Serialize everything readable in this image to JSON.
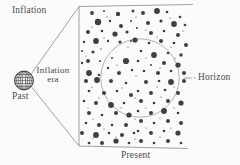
{
  "labels": {
    "inflation": "Inflation",
    "inflation_era_line1": "Inflation",
    "inflation_era_line2": "era",
    "past": "Past",
    "horizon": "Horizon",
    "present": "Present"
  },
  "colors": {
    "background": "#fbfbfb",
    "dot": "#3f3f3f",
    "line": "#8a8a8a",
    "horizon_circle": "#a8a8a8",
    "sphere": "#4a4a4a",
    "text": "#4a4a4a"
  },
  "geometry": {
    "box": {
      "top_right": [
        193,
        4.5
      ],
      "top_left": [
        79,
        6.5
      ],
      "bottom_left": [
        79,
        146
      ],
      "bottom_right": [
        188,
        148.5
      ]
    },
    "diagonal_upper": {
      "x1": 31.5,
      "y1": 73.5,
      "x2": 79,
      "y2": 6.5
    },
    "diagonal_lower": {
      "x1": 32,
      "y1": 87.5,
      "x2": 79,
      "y2": 146
    },
    "sphere": {
      "cx": 24,
      "cy": 80.5,
      "r": 9.5
    },
    "horizon_circle": {
      "cx": 140,
      "cy": 78,
      "r": 39.2
    },
    "connector": {
      "x1": 183.5,
      "y1": 78,
      "x2": 195.5,
      "y2": 78
    }
  },
  "dots": [
    [
      92,
      13,
      1.9
    ],
    [
      104,
      11,
      1.0
    ],
    [
      118,
      14,
      2.2
    ],
    [
      133,
      11,
      1.4
    ],
    [
      98,
      22,
      3.2
    ],
    [
      110,
      21,
      1.2
    ],
    [
      121,
      26,
      2.0
    ],
    [
      131,
      21,
      1.0
    ],
    [
      88,
      32,
      2.0
    ],
    [
      102,
      31,
      1.3
    ],
    [
      115,
      34,
      2.6
    ],
    [
      127,
      32,
      1.6
    ],
    [
      84,
      42,
      1.2
    ],
    [
      96,
      41,
      2.9
    ],
    [
      108,
      41,
      1.2
    ],
    [
      120,
      42,
      1.6
    ],
    [
      131,
      41,
      1.0
    ],
    [
      82,
      51,
      1.0
    ],
    [
      93,
      52,
      1.6
    ],
    [
      101,
      49,
      0.7
    ],
    [
      88,
      61,
      2.0
    ],
    [
      82,
      63,
      1.2
    ],
    [
      100,
      61,
      1.0
    ],
    [
      112,
      58,
      1.0
    ],
    [
      126,
      61,
      3.1
    ],
    [
      108,
      68,
      1.2
    ],
    [
      89,
      73,
      2.9
    ],
    [
      99,
      75,
      1.2
    ],
    [
      119,
      73,
      2.0
    ],
    [
      132,
      70,
      1.2
    ],
    [
      143,
      13,
      2.0
    ],
    [
      157,
      11,
      2.9
    ],
    [
      167,
      12,
      1.3
    ],
    [
      180,
      17,
      1.3
    ],
    [
      148,
      23,
      2.0
    ],
    [
      161,
      21,
      1.6
    ],
    [
      174,
      24,
      2.9
    ],
    [
      185,
      25,
      1.3
    ],
    [
      137,
      28,
      1.0
    ],
    [
      151,
      33,
      2.0
    ],
    [
      164,
      31,
      1.3
    ],
    [
      178,
      35,
      2.0
    ],
    [
      135,
      40,
      2.6
    ],
    [
      149,
      43,
      1.3
    ],
    [
      161,
      41,
      2.0
    ],
    [
      174,
      43,
      1.3
    ],
    [
      186,
      45,
      2.0
    ],
    [
      141,
      51,
      1.3
    ],
    [
      154,
      55,
      2.9
    ],
    [
      168,
      53,
      1.3
    ],
    [
      181,
      55,
      1.7
    ],
    [
      138,
      61,
      1.3
    ],
    [
      151,
      65,
      1.0
    ],
    [
      164,
      63,
      2.0
    ],
    [
      178,
      65,
      2.6
    ],
    [
      144,
      71,
      1.3
    ],
    [
      158,
      73,
      2.0
    ],
    [
      171,
      71,
      1.3
    ],
    [
      184,
      73,
      2.0
    ],
    [
      86,
      81,
      2.0
    ],
    [
      97,
      80,
      2.9
    ],
    [
      111,
      81,
      2.0
    ],
    [
      126,
      83,
      1.3
    ],
    [
      89,
      91,
      1.3
    ],
    [
      104,
      93,
      2.0
    ],
    [
      117,
      91,
      1.3
    ],
    [
      131,
      95,
      2.0
    ],
    [
      84,
      101,
      1.3
    ],
    [
      96,
      103,
      2.0
    ],
    [
      111,
      105,
      2.9
    ],
    [
      124,
      103,
      1.3
    ],
    [
      89,
      113,
      2.0
    ],
    [
      102,
      115,
      1.3
    ],
    [
      116,
      113,
      2.0
    ],
    [
      129,
      115,
      2.6
    ],
    [
      86,
      123,
      1.3
    ],
    [
      99,
      125,
      2.0
    ],
    [
      112,
      125,
      1.3
    ],
    [
      126,
      125,
      2.0
    ],
    [
      82,
      133,
      2.0
    ],
    [
      96,
      135,
      2.9
    ],
    [
      109,
      133,
      1.3
    ],
    [
      122,
      135,
      2.0
    ],
    [
      134,
      133,
      1.3
    ],
    [
      89,
      143,
      1.3
    ],
    [
      102,
      143,
      2.0
    ],
    [
      116,
      141,
      2.6
    ],
    [
      129,
      143,
      1.3
    ],
    [
      146,
      82,
      2.0
    ],
    [
      159,
      81,
      1.3
    ],
    [
      171,
      82,
      2.9
    ],
    [
      184,
      81,
      2.0
    ],
    [
      138,
      91,
      1.3
    ],
    [
      151,
      93,
      2.0
    ],
    [
      165,
      90,
      1.3
    ],
    [
      178,
      93,
      2.0
    ],
    [
      141,
      101,
      2.0
    ],
    [
      154,
      103,
      1.3
    ],
    [
      168,
      101,
      2.0
    ],
    [
      181,
      103,
      2.6
    ],
    [
      138,
      111,
      1.3
    ],
    [
      151,
      113,
      2.0
    ],
    [
      164,
      111,
      2.9
    ],
    [
      178,
      113,
      1.3
    ],
    [
      141,
      121,
      2.0
    ],
    [
      154,
      123,
      1.3
    ],
    [
      168,
      121,
      2.0
    ],
    [
      181,
      123,
      2.0
    ],
    [
      138,
      131,
      1.3
    ],
    [
      151,
      133,
      2.0
    ],
    [
      164,
      131,
      1.3
    ],
    [
      178,
      133,
      2.6
    ],
    [
      141,
      141,
      2.0
    ],
    [
      154,
      143,
      1.3
    ],
    [
      168,
      141,
      2.0
    ],
    [
      181,
      143,
      1.3
    ],
    [
      107,
      17,
      0.6
    ],
    [
      136,
      17,
      0.6
    ],
    [
      170,
      18,
      0.6
    ],
    [
      92,
      27,
      0.6
    ],
    [
      146,
      30,
      0.6
    ],
    [
      183,
      31,
      0.6
    ],
    [
      104,
      38,
      0.6
    ],
    [
      157,
      37,
      0.6
    ],
    [
      128,
      47,
      0.6
    ],
    [
      171,
      47,
      0.6
    ],
    [
      86,
      56,
      0.6
    ],
    [
      146,
      58,
      0.6
    ],
    [
      175,
      58,
      0.6
    ],
    [
      117,
      65,
      0.6
    ],
    [
      160,
      68,
      0.6
    ],
    [
      136,
      76,
      0.6
    ],
    [
      92,
      87,
      0.6
    ],
    [
      122,
      88,
      0.6
    ],
    [
      157,
      87,
      0.6
    ],
    [
      174,
      87,
      0.6
    ],
    [
      99,
      98,
      0.6
    ],
    [
      135,
      98,
      0.6
    ],
    [
      161,
      97,
      0.6
    ],
    [
      88,
      108,
      0.6
    ],
    [
      121,
      108,
      0.6
    ],
    [
      146,
      108,
      0.6
    ],
    [
      174,
      108,
      0.6
    ],
    [
      93,
      119,
      0.6
    ],
    [
      135,
      119,
      0.6
    ],
    [
      160,
      118,
      0.6
    ],
    [
      104,
      129,
      0.6
    ],
    [
      146,
      128,
      0.6
    ],
    [
      171,
      128,
      0.6
    ],
    [
      116,
      137,
      0.6
    ],
    [
      135,
      139,
      0.6
    ],
    [
      160,
      137,
      0.6
    ],
    [
      93,
      138,
      0.6
    ]
  ]
}
